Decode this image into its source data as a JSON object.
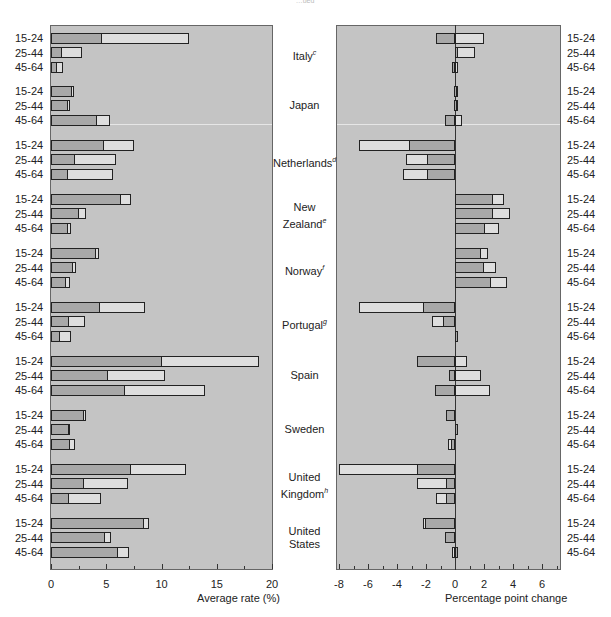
{
  "header": {
    "partial_caption": "…ued"
  },
  "chart_data": [
    {
      "type": "bar",
      "orientation": "horizontal",
      "title": "",
      "xlabel": "Average rate (%)",
      "ylabel": "",
      "xlim": [
        0,
        20
      ],
      "xticks": [
        0,
        5,
        10,
        15,
        20
      ],
      "grid": false,
      "series_note": "Two overlapping series per row: dark (inner) and light (outer/total)",
      "categories": [
        "Italy c",
        "Japan",
        "Netherlands d",
        "New Zealand e",
        "Norway f",
        "Portugal g",
        "Spain",
        "Sweden",
        "United Kingdom h",
        "United States"
      ],
      "age_groups": [
        "15-24",
        "25-44",
        "45-64"
      ],
      "series": [
        {
          "name": "dark",
          "values": [
            [
              4.6,
              1.0,
              0.5
            ],
            [
              1.9,
              1.5,
              4.2
            ],
            [
              4.8,
              2.2,
              1.5
            ],
            [
              6.3,
              2.5,
              1.5
            ],
            [
              4.1,
              2.0,
              1.4
            ],
            [
              4.4,
              1.6,
              0.8
            ],
            [
              10.0,
              5.2,
              6.7
            ],
            [
              3.0,
              1.6,
              1.7
            ],
            [
              7.2,
              3.0,
              1.6
            ],
            [
              8.4,
              4.9,
              6.1
            ]
          ]
        },
        {
          "name": "light",
          "values": [
            [
              12.5,
              2.8,
              1.1
            ],
            [
              2.1,
              1.7,
              5.3
            ],
            [
              7.5,
              5.9,
              5.6
            ],
            [
              7.2,
              3.2,
              1.8
            ],
            [
              4.3,
              2.3,
              1.7
            ],
            [
              8.5,
              3.1,
              1.8
            ],
            [
              18.8,
              10.3,
              13.9
            ],
            [
              3.2,
              1.7,
              2.2
            ],
            [
              12.2,
              7.0,
              4.5
            ],
            [
              8.9,
              5.4,
              7.1
            ]
          ]
        }
      ]
    },
    {
      "type": "bar",
      "orientation": "horizontal",
      "title": "",
      "xlabel": "Percentage point change",
      "ylabel": "",
      "xlim": [
        -8.2,
        7.2
      ],
      "xticks": [
        -8,
        -6,
        -4,
        -2,
        0,
        2,
        4,
        6
      ],
      "grid": false,
      "series_note": "Two series per row drawn from zero: dark and light",
      "categories": [
        "Italy c",
        "Japan",
        "Netherlands d",
        "New Zealand e",
        "Norway f",
        "Portugal g",
        "Spain",
        "Sweden",
        "United Kingdom h",
        "United States"
      ],
      "age_groups": [
        "15-24",
        "25-44",
        "45-64"
      ],
      "series": [
        {
          "name": "dark",
          "values": [
            [
              -1.3,
              0.2,
              -0.2
            ],
            [
              -0.1,
              -0.1,
              -0.7
            ],
            [
              -3.2,
              -1.9,
              -1.9
            ],
            [
              2.6,
              2.6,
              2.1
            ],
            [
              1.8,
              2.0,
              2.5
            ],
            [
              -2.2,
              -0.8,
              0.0
            ],
            [
              -2.6,
              -0.4,
              -1.4
            ],
            [
              -0.6,
              0.1,
              -0.3
            ],
            [
              -2.6,
              -0.6,
              -0.6
            ],
            [
              -2.1,
              -0.7,
              0.2
            ]
          ]
        },
        {
          "name": "light",
          "values": [
            [
              2.0,
              1.4,
              0.2
            ],
            [
              0.1,
              0.2,
              0.5
            ],
            [
              -6.6,
              -3.4,
              -3.6
            ],
            [
              3.4,
              3.8,
              3.0
            ],
            [
              2.3,
              2.8,
              3.6
            ],
            [
              -6.6,
              -1.6,
              0.0
            ],
            [
              0.8,
              1.8,
              2.4
            ],
            [
              -0.6,
              0.1,
              -0.5
            ],
            [
              -8.0,
              -2.6,
              -1.3
            ],
            [
              -2.2,
              -0.7,
              -0.2
            ]
          ]
        }
      ]
    }
  ],
  "countries": [
    {
      "name": "Italy",
      "sup": "c"
    },
    {
      "name": "Japan",
      "sup": ""
    },
    {
      "name": "Netherlands",
      "sup": "d"
    },
    {
      "name": "New Zealand",
      "sup": "e"
    },
    {
      "name": "Norway",
      "sup": "f"
    },
    {
      "name": "Portugal",
      "sup": "g"
    },
    {
      "name": "Spain",
      "sup": ""
    },
    {
      "name": "Sweden",
      "sup": ""
    },
    {
      "name": "United Kingdom",
      "sup": "h"
    },
    {
      "name": "United States",
      "sup": ""
    }
  ],
  "left_axis": {
    "label": "Average rate (%)",
    "ticks": [
      "0",
      "5",
      "10",
      "15",
      "20"
    ]
  },
  "right_axis": {
    "label": "Percentage point change",
    "ticks": [
      "-8",
      "-6",
      "-4",
      "-2",
      "0",
      "2",
      "4",
      "6"
    ]
  },
  "age_labels": [
    "15-24",
    "25-44",
    "45-64"
  ],
  "colors": {
    "panel_bg": "#c4c4c4",
    "dark_bar": "#a8a8a8",
    "light_bar": "#dedede",
    "border": "#222222"
  }
}
